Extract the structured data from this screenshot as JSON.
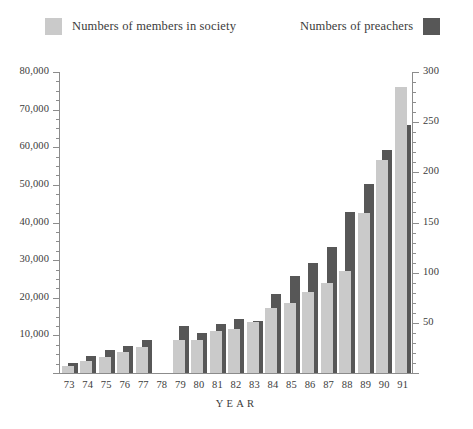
{
  "legend": {
    "series_members": {
      "label": "Numbers of members in society",
      "color": "#cacaca"
    },
    "series_preachers": {
      "label": "Numbers of preachers",
      "color": "#575757"
    }
  },
  "axes": {
    "x_title": "YEAR",
    "left_ticks": [
      "10,000",
      "20,000",
      "30,000",
      "40,000",
      "50,000",
      "60,000",
      "70,000",
      "80,000"
    ],
    "right_ticks": [
      "50",
      "100",
      "150",
      "200",
      "250",
      "300"
    ]
  },
  "chart_data": {
    "type": "bar",
    "title": "",
    "subtitle": "",
    "xlabel": "YEAR",
    "ylabel": "",
    "grid": false,
    "legend_position": "top",
    "categories": [
      "73",
      "74",
      "75",
      "76",
      "77",
      "78",
      "79",
      "80",
      "81",
      "82",
      "83",
      "84",
      "85",
      "86",
      "87",
      "88",
      "89",
      "90",
      "91"
    ],
    "axis_left": {
      "label": "Numbers of members in society",
      "min": 0,
      "max": 80000,
      "tick_step": 10000,
      "minor_step": 2500
    },
    "axis_right": {
      "label": "Numbers of preachers",
      "min": 0,
      "max": 300,
      "tick_step": 50,
      "minor_step": 10
    },
    "series": [
      {
        "name": "Numbers of members in society",
        "axis": "left",
        "color": "#cacaca",
        "values": [
          1800,
          3300,
          4200,
          5500,
          6800,
          null,
          8800,
          8800,
          11200,
          11800,
          13600,
          17200,
          18500,
          21500,
          24000,
          27000,
          42500,
          56500,
          76000
        ]
      },
      {
        "name": "Numbers of preachers",
        "axis": "right",
        "color": "#575757",
        "values": [
          10,
          17,
          23,
          27,
          33,
          null,
          47,
          40,
          49,
          54,
          52,
          79,
          97,
          110,
          126,
          160,
          188,
          222,
          247
        ]
      }
    ]
  }
}
